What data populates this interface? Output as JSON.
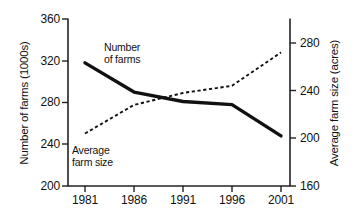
{
  "chart_data": {
    "type": "line",
    "title": "",
    "xlabel": "",
    "categories": [
      "1981",
      "1986",
      "1991",
      "1996",
      "2001"
    ],
    "x": [
      1981,
      1986,
      1991,
      1996,
      2001
    ],
    "grid": false,
    "legend_position": "inline-annotations",
    "axes": {
      "left": {
        "label": "Number of farms  (1000s)",
        "ticks": [
          "200",
          "240",
          "280",
          "320",
          "360"
        ],
        "tick_values": [
          200,
          240,
          280,
          320,
          360
        ],
        "range": [
          200,
          360
        ]
      },
      "right": {
        "label": "Average farm size (acres)",
        "ticks": [
          "160",
          "200",
          "240",
          "280"
        ],
        "tick_values": [
          160,
          200,
          240,
          280
        ],
        "range": [
          160,
          300
        ]
      },
      "bottom": {
        "ticks": [
          "1981",
          "1986",
          "1991",
          "1996",
          "2001"
        ]
      }
    },
    "series": [
      {
        "name": "Number of farms",
        "annotation": "Number\nof farms",
        "axis": "left",
        "style": "solid",
        "color": "#111111",
        "values": [
          318,
          290,
          281,
          278,
          248
        ]
      },
      {
        "name": "Average farm size",
        "annotation": "Average\nfarm size",
        "axis": "right",
        "style": "dashed",
        "color": "#111111",
        "values": [
          204,
          228,
          238,
          244,
          272
        ]
      }
    ]
  },
  "annotations": {
    "number_of_farms_line1": "Number",
    "number_of_farms_line2": "of farms",
    "average_farm_size_line1": "Average",
    "average_farm_size_line2": "farm size"
  },
  "axis_titles": {
    "left": "Number of farms  (1000s)",
    "right": "Average farm size (acres)"
  },
  "ticks": {
    "left": [
      "360",
      "320",
      "280",
      "240",
      "200"
    ],
    "right": [
      "280",
      "240",
      "200",
      "160"
    ],
    "bottom": [
      "1981",
      "1986",
      "1991",
      "1996",
      "2001"
    ]
  }
}
